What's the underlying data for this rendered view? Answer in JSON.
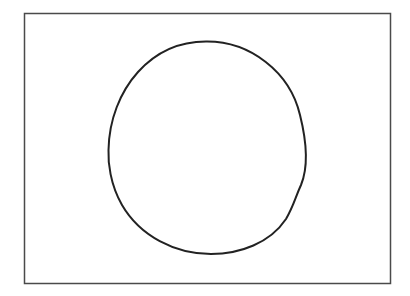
{
  "diagram": {
    "background": "#ffffff",
    "frame": {
      "x": 24,
      "y": 13,
      "width": 367,
      "height": 270,
      "stroke": "#4a4a4a",
      "stroke_width": 1.5
    },
    "shape": {
      "type": "hand-drawn-circle",
      "cx": 207,
      "cy": 148,
      "rx": 99,
      "ry": 107,
      "stroke": "#222222",
      "stroke_width": 2
    }
  }
}
